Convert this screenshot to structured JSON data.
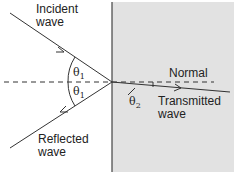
{
  "diagram": {
    "type": "wave-refraction-at-interface",
    "colors": {
      "medium2_fill": "#e2e2e2",
      "line": "#333333",
      "background": "#ffffff"
    },
    "labels": {
      "incident_line1": "Incident",
      "incident_line2": "wave",
      "reflected_line1": "Reflected",
      "reflected_line2": "wave",
      "transmitted_line1": "Transmitted",
      "transmitted_line2": "wave",
      "normal": "Normal",
      "theta1_upper": "θ",
      "theta1_upper_sub": "1",
      "theta1_lower": "θ",
      "theta1_lower_sub": "1",
      "theta2": "θ",
      "theta2_sub": "2"
    }
  }
}
